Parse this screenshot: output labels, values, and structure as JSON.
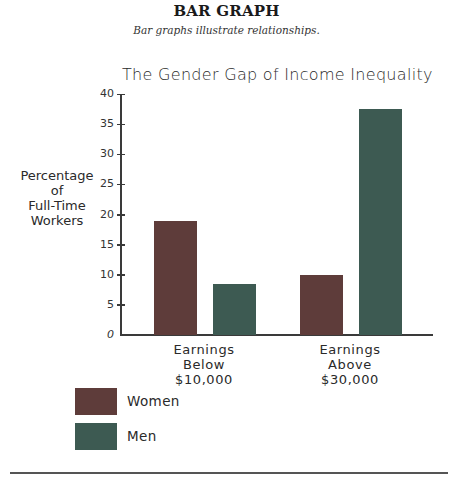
{
  "header": {
    "title": "BAR GRAPH",
    "subtitle": "Bar graphs illustrate relationships."
  },
  "colors": {
    "women": "#5e3c3a",
    "men": "#3d5a52",
    "axis": "#3a3a3a"
  },
  "chart_data": {
    "type": "bar",
    "title": "The Gender Gap of Income Inequality",
    "xlabel": "",
    "ylabel": "Percentage of Full-Time Workers",
    "ylabel_lines": [
      "Percentage",
      "of",
      "Full-Time",
      "Workers"
    ],
    "ylim": [
      0,
      40
    ],
    "yticks": [
      0,
      5,
      10,
      15,
      20,
      25,
      30,
      35,
      40
    ],
    "grid": false,
    "legend_position": "bottom-left",
    "categories": [
      "Earnings Below $10,000",
      "Earnings Above $30,000"
    ],
    "category_lines": [
      [
        "Earnings",
        "Below",
        "$10,000"
      ],
      [
        "Earnings",
        "Above",
        "$30,000"
      ]
    ],
    "series": [
      {
        "name": "Women",
        "color": "#5e3c3a",
        "values": [
          19,
          10
        ]
      },
      {
        "name": "Men",
        "color": "#3d5a52",
        "values": [
          8.5,
          37.5
        ]
      }
    ]
  },
  "legend": {
    "items": [
      {
        "label": "Women",
        "color": "#5e3c3a"
      },
      {
        "label": "Men",
        "color": "#3d5a52"
      }
    ]
  }
}
